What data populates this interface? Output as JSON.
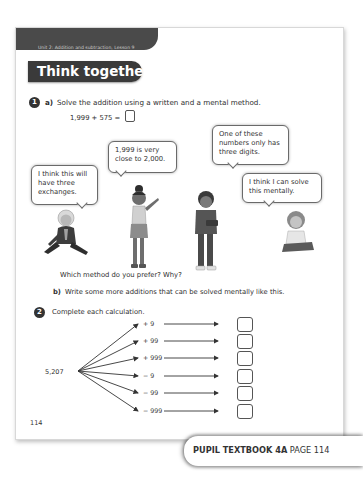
{
  "header": {
    "unit_label": "Unit 2: Addition and subtraction, Lesson 9",
    "section_title": "Think together"
  },
  "question1": {
    "number": "1",
    "part_a_letter": "a)",
    "part_a_text": "Solve the addition using a written and a mental method.",
    "equation": "1,999 + 575 =",
    "bubbles": [
      {
        "speaker": "boy-sitting",
        "text": "I think this will have three exchanges."
      },
      {
        "speaker": "girl-pointing",
        "text": "1,999 is very close to 2,000."
      },
      {
        "speaker": "boy-standing",
        "text": "One of these numbers only has three digits."
      },
      {
        "speaker": "girl-sitting",
        "text": "I think I can solve this mentally."
      }
    ],
    "prompt": "Which method do you prefer? Why?",
    "part_b_letter": "b)",
    "part_b_text": "Write some more additions that can be solved mentally like this."
  },
  "question2": {
    "number": "2",
    "text": "Complete each calculation.",
    "start_value": "5,207",
    "operations": [
      "+ 9",
      "+ 99",
      "+ 999",
      "− 9",
      "− 99",
      "− 999"
    ]
  },
  "page_number": "114",
  "footer": {
    "book": "PUPIL TEXTBOOK 4A",
    "page": "PAGE 114"
  },
  "colors": {
    "dark_bar": "#4a4a4a",
    "heading_bg": "#3a3a3a",
    "text": "#2f2f2f"
  }
}
